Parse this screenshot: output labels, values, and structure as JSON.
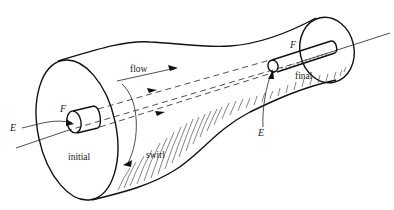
{
  "diagram": {
    "type": "flow-swirl-tube-illustration",
    "labels": {
      "flow": "flow",
      "swirl": "swirl",
      "initial": "initial",
      "final": "final",
      "F_left": "F",
      "F_right": "F",
      "E_left": "E",
      "E_right": "E"
    },
    "colors": {
      "line": "#111111",
      "background": "#ffffff"
    }
  }
}
